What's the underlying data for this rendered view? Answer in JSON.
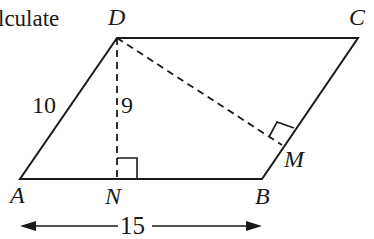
{
  "text": {
    "fragment": "lculate"
  },
  "labels": {
    "D": "D",
    "C": "C",
    "A": "A",
    "B": "B",
    "N": "N",
    "M": "M",
    "side_AD": "10",
    "height_DN": "9",
    "base_AB": "15"
  },
  "colors": {
    "stroke": "#1a1a1a",
    "background": "#ffffff"
  }
}
